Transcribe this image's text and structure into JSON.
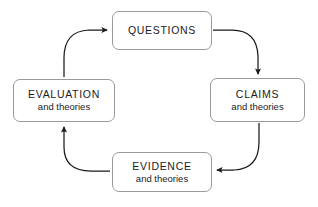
{
  "diagram": {
    "type": "cycle-flowchart",
    "background_color": "#ffffff",
    "node_border_color": "#9a9a9a",
    "arrow_color": "#1b1b1b",
    "text_color": "#1b1b1b",
    "nodes": [
      {
        "id": "questions",
        "title": "QUESTIONS",
        "subtitle": ""
      },
      {
        "id": "claims",
        "title": "CLAIMS",
        "subtitle": "and theories"
      },
      {
        "id": "evidence",
        "title": "EVIDENCE",
        "subtitle": "and theories"
      },
      {
        "id": "evaluation",
        "title": "EVALUATION",
        "subtitle": "and theories"
      }
    ],
    "arrows": [
      {
        "id": "questions-to-claims",
        "from": "questions",
        "to": "claims",
        "direction": "down"
      },
      {
        "id": "claims-to-evidence",
        "from": "claims",
        "to": "evidence",
        "direction": "left"
      },
      {
        "id": "evidence-to-evaluation",
        "from": "evidence",
        "to": "evaluation",
        "direction": "up"
      },
      {
        "id": "evaluation-to-questions",
        "from": "evaluation",
        "to": "questions",
        "direction": "right"
      }
    ]
  }
}
